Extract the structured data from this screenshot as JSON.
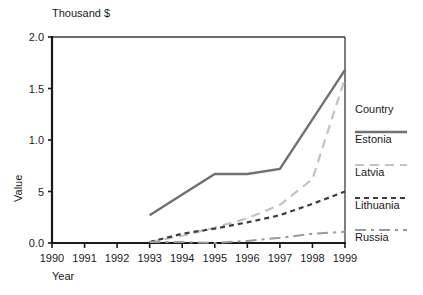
{
  "chart_data": {
    "type": "line",
    "title": "",
    "unit_label": "Thousand $",
    "xlabel": "Year",
    "ylabel": "Value",
    "x": [
      1990,
      1991,
      1992,
      1993,
      1994,
      1995,
      1996,
      1997,
      1998,
      1999
    ],
    "xtick_labels": [
      "1990",
      "1991",
      "1992",
      "1993",
      "1994",
      "1995",
      "1996",
      "1997",
      "1998",
      "1999"
    ],
    "ytick_labels": [
      "0.0",
      "5",
      "1.0",
      "1.5",
      "2.0"
    ],
    "ytick_values": [
      0.0,
      0.5,
      1.0,
      1.5,
      2.0
    ],
    "ylim": [
      0.0,
      2.0
    ],
    "xlim": [
      1990,
      1999
    ],
    "grid": false,
    "legend_position": "right",
    "legend_title": "Country",
    "series": [
      {
        "name": "Estonia",
        "style": "solid",
        "color": "#707070",
        "x": [
          1993,
          1994,
          1995,
          1996,
          1997,
          1998,
          1999
        ],
        "values": [
          0.27,
          0.47,
          0.67,
          0.67,
          0.72,
          1.2,
          1.68
        ]
      },
      {
        "name": "Latvia",
        "style": "long-dash",
        "color": "#c2c2c2",
        "x": [
          1993,
          1994,
          1995,
          1996,
          1997,
          1998,
          1999
        ],
        "values": [
          0.01,
          0.07,
          0.15,
          0.24,
          0.37,
          0.62,
          1.6
        ]
      },
      {
        "name": "Lithuania",
        "style": "short-dash",
        "color": "#3d3d3d",
        "x": [
          1993,
          1994,
          1995,
          1996,
          1997,
          1998,
          1999
        ],
        "values": [
          0.01,
          0.09,
          0.14,
          0.2,
          0.27,
          0.38,
          0.5
        ]
      },
      {
        "name": "Russia",
        "style": "dash-dot",
        "color": "#9a9a9a",
        "x": [
          1993,
          1994,
          1995,
          1996,
          1997,
          1998,
          1999
        ],
        "values": [
          0.01,
          0.01,
          0.0,
          0.02,
          0.05,
          0.09,
          0.11
        ]
      }
    ]
  },
  "legend": {
    "title": "Country",
    "entries": [
      {
        "label": "Estonia"
      },
      {
        "label": "Latvia"
      },
      {
        "label": "Lithuania"
      },
      {
        "label": "Russia"
      }
    ]
  }
}
